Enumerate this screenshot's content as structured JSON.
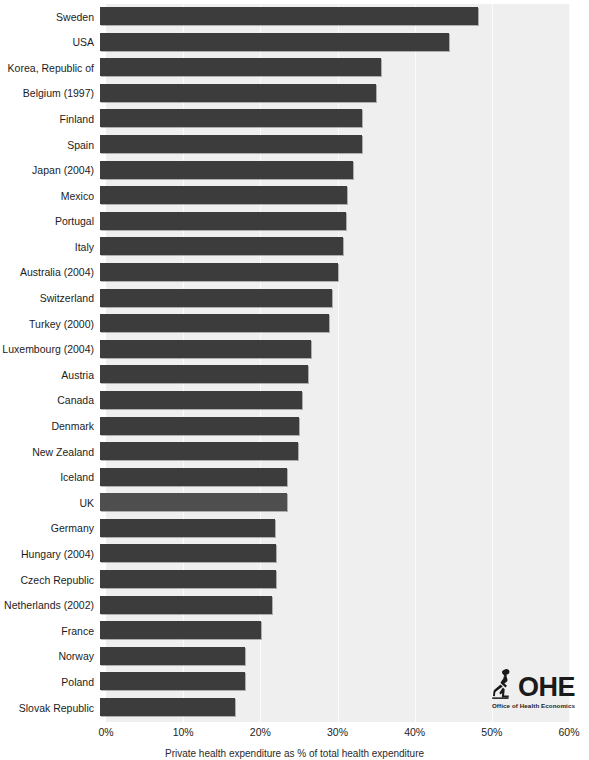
{
  "chart_data": {
    "type": "bar",
    "orientation": "horizontal",
    "title": "",
    "xlabel": "Private health expenditure as % of total health expenditure",
    "ylabel": "",
    "xlim": [
      0,
      60
    ],
    "xunit": "%",
    "grid": true,
    "legend": null,
    "xtick_labels": [
      "0%",
      "10%",
      "20%",
      "30%",
      "40%",
      "50%",
      "60%"
    ],
    "xtick_values": [
      0,
      10,
      20,
      30,
      40,
      50,
      60
    ],
    "categories": [
      "Sweden",
      "USA",
      "Korea, Republic of",
      "Belgium (1997)",
      "Finland",
      "Spain",
      "Japan (2004)",
      "Mexico",
      "Portugal",
      "Italy",
      "Australia (2004)",
      "Switzerland",
      "Turkey (2000)",
      "Luxembourg (2004)",
      "Austria",
      "Canada",
      "Denmark",
      "New Zealand",
      "Iceland",
      "UK",
      "Germany",
      "Hungary (2004)",
      "Czech Republic",
      "Netherlands (2002)",
      "France",
      "Norway",
      "Poland",
      "Slovak Republic"
    ],
    "values": [
      49.0,
      45.2,
      36.4,
      35.8,
      34.0,
      33.9,
      32.8,
      32.0,
      31.9,
      31.5,
      30.9,
      30.0,
      29.7,
      27.3,
      26.9,
      26.2,
      25.8,
      25.6,
      24.2,
      24.2,
      22.7,
      22.8,
      22.8,
      22.3,
      20.9,
      18.8,
      18.8,
      17.5
    ],
    "highlight_category": "UK"
  },
  "colors": {
    "bar": "#3c3c3c",
    "bar_highlight": "#4e4e4e",
    "plot_background": "#efefef",
    "gridline": "#fbfbfb",
    "page_background": "#ffffff",
    "text": "#1c1c1c"
  },
  "logo": {
    "mark": "ohe-statue-icon",
    "wordmark": "OHE",
    "subtitle": "Office of Health Economics"
  }
}
